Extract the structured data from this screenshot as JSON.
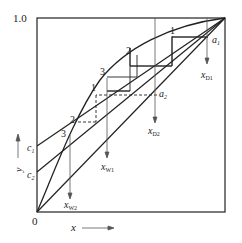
{
  "diagram": {
    "type": "McCabe-Thiele stage construction",
    "axes": {
      "x_label": "x",
      "y_label": "y",
      "origin_label": "0",
      "y_max_label": "1.0"
    },
    "intercepts": {
      "c1": "c1",
      "c2": "c2"
    },
    "points": {
      "a1": "a1",
      "a2": "a2"
    },
    "compositions": {
      "xD1": {
        "main": "x",
        "sub": "D1"
      },
      "xD2": {
        "main": "x",
        "sub": "D2"
      },
      "xW1": {
        "main": "x",
        "sub": "W1"
      },
      "xW2": {
        "main": "x",
        "sub": "W2"
      }
    },
    "upper_stage_labels": [
      "1",
      "2",
      "3"
    ],
    "lower_stage_labels": [
      "1",
      "2",
      "3"
    ],
    "colors": {
      "line": "#222222",
      "arrow": "#555555"
    }
  }
}
